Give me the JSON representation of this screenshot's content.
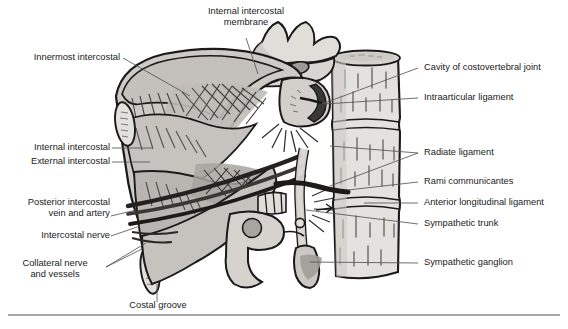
{
  "figure": {
    "style": "greyscale anatomical line illustration with leader-line labels",
    "colors": {
      "outline": "#1a1a1a",
      "bone_light": "#e2e0dc",
      "bone_mid": "#c9c6c1",
      "muscle_shade": "#b2afaa",
      "deep_shade": "#8e8b86",
      "vessel_dark": "#2a2a2a",
      "leader_line": "#555555",
      "text": "#1a1a1a",
      "rule": "#8a8a8a",
      "background": "#ffffff"
    },
    "footer_rule": true
  },
  "labels": {
    "internal_intercostal_membrane": "Internal intercostal\nmembrane",
    "innermost_intercostal": "Innermost intercostal",
    "internal_intercostal": "Internal intercostal",
    "external_intercostal": "External intercostal",
    "posterior_intercostal_vein_and_artery": "Posterior intercostal\nvein and artery",
    "intercostal_nerve": "Intercostal nerve",
    "collateral_nerve_and_vessels": "Collateral nerve\nand vessels",
    "costal_groove": "Costal groove",
    "cavity_of_costovertebral_joint": "Cavity of costovertebral joint",
    "intraarticular_ligament": "Intraarticular ligament",
    "radiate_ligament": "Radiate ligament",
    "rami_communicantes": "Rami communicantes",
    "anterior_longitudinal_ligament": "Anterior longitudinal ligament",
    "sympathetic_trunk": "Sympathetic trunk",
    "sympathetic_ganglion": "Sympathetic ganglion"
  }
}
